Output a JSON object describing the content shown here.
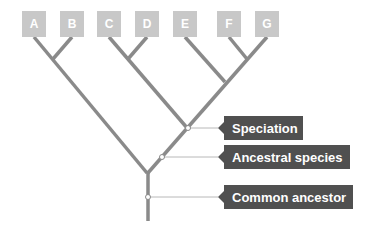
{
  "taxa": [
    {
      "label": "A",
      "x": 22
    },
    {
      "label": "B",
      "x": 60
    },
    {
      "label": "C",
      "x": 97
    },
    {
      "label": "D",
      "x": 135
    },
    {
      "label": "E",
      "x": 173
    },
    {
      "label": "F",
      "x": 217
    },
    {
      "label": "G",
      "x": 255
    }
  ],
  "callouts": {
    "speciation": {
      "label": "Speciation"
    },
    "ancestral_species": {
      "label": "Ancestral species"
    },
    "common_ancestor": {
      "label": "Common ancestor"
    }
  },
  "colors": {
    "branch": "#8a8a8a",
    "taxon_box": "#c8c8c8",
    "label_box": "#505050",
    "leader": "#b0b0b0"
  }
}
